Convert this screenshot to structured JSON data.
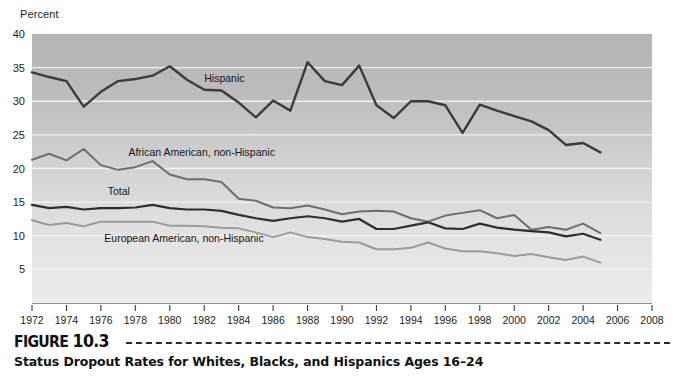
{
  "figure": {
    "label_word": "FIGURE",
    "label_number": "10.3",
    "caption": "Status Dropout Rates for Whites, Blacks, and Hispanics Ages 16–24"
  },
  "chart_data": {
    "type": "line",
    "title": "",
    "subtitle": "",
    "xlabel": "",
    "ylabel": "Percent",
    "ylim": [
      0,
      40
    ],
    "xlim": [
      1972,
      2008
    ],
    "yticks": [
      5,
      10,
      15,
      20,
      25,
      30,
      35,
      40
    ],
    "xticks": [
      1972,
      1974,
      1976,
      1978,
      1980,
      1982,
      1984,
      1986,
      1988,
      1990,
      1992,
      1994,
      1996,
      1998,
      2000,
      2002,
      2004,
      2006,
      2008
    ],
    "grid": "horizontal",
    "legend": "inline-annotations",
    "background": "vertical-gray-gradient",
    "x": [
      1972,
      1973,
      1974,
      1975,
      1976,
      1977,
      1978,
      1979,
      1980,
      1981,
      1982,
      1983,
      1984,
      1985,
      1986,
      1987,
      1988,
      1989,
      1990,
      1991,
      1992,
      1993,
      1994,
      1995,
      1996,
      1997,
      1998,
      1999,
      2000,
      2001,
      2002,
      2003,
      2004,
      2005
    ],
    "series": [
      {
        "name": "Hispanic",
        "color": "#3b3b3b",
        "width": 2.4,
        "label_x": 1982,
        "label_y": 32.9,
        "values": [
          34.3,
          33.6,
          33.0,
          29.2,
          31.4,
          33.0,
          33.3,
          33.8,
          35.2,
          33.2,
          31.7,
          31.6,
          29.8,
          27.6,
          30.1,
          28.6,
          35.8,
          33.0,
          32.4,
          35.3,
          29.4,
          27.5,
          30.0,
          30.0,
          29.4,
          25.3,
          29.5,
          28.6,
          27.8,
          27.0,
          25.7,
          23.5,
          23.8,
          22.4
        ]
      },
      {
        "name": "African American, non-Hispanic",
        "color": "#6e6e6e",
        "width": 2.0,
        "label_x": 1977.6,
        "label_y": 21.8,
        "values": [
          21.3,
          22.2,
          21.2,
          22.9,
          20.5,
          19.8,
          20.2,
          21.1,
          19.1,
          18.4,
          18.4,
          18.0,
          15.5,
          15.2,
          14.2,
          14.1,
          14.5,
          13.9,
          13.2,
          13.6,
          13.7,
          13.6,
          12.6,
          12.1,
          13.0,
          13.4,
          13.8,
          12.6,
          13.1,
          10.9,
          11.3,
          10.9,
          11.8,
          10.4
        ]
      },
      {
        "name": "Total",
        "color": "#2e2e2e",
        "width": 2.2,
        "label_x": 1976.4,
        "label_y": 16.1,
        "values": [
          14.6,
          14.1,
          14.3,
          13.9,
          14.1,
          14.1,
          14.2,
          14.6,
          14.1,
          13.9,
          13.9,
          13.7,
          13.1,
          12.6,
          12.2,
          12.6,
          12.9,
          12.6,
          12.1,
          12.5,
          11.0,
          11.0,
          11.5,
          12.0,
          11.1,
          11.0,
          11.8,
          11.2,
          10.9,
          10.7,
          10.5,
          9.9,
          10.3,
          9.4
        ]
      },
      {
        "name": "European American, non-Hispanic",
        "color": "#9a9a9a",
        "width": 2.0,
        "label_x": 1976.2,
        "label_y": 9.1,
        "values": [
          12.3,
          11.6,
          11.9,
          11.4,
          12.1,
          12.1,
          12.1,
          12.1,
          11.5,
          11.5,
          11.4,
          11.2,
          11.1,
          10.5,
          9.8,
          10.5,
          9.8,
          9.5,
          9.1,
          9.0,
          8.0,
          8.0,
          8.2,
          9.0,
          8.1,
          7.7,
          7.7,
          7.4,
          7.0,
          7.3,
          6.8,
          6.4,
          6.9,
          6.0
        ]
      }
    ]
  }
}
